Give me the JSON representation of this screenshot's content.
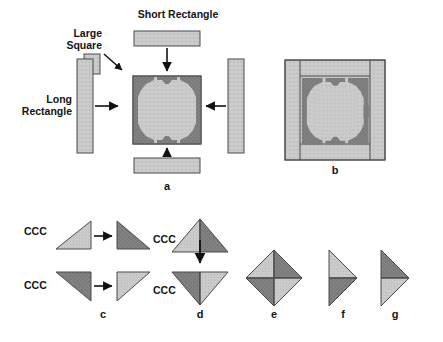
{
  "figure": {
    "title_present": false,
    "background": "#ffffff",
    "colors": {
      "light_fabric": "#c9c9c9",
      "light_fabric_dot": "#bdbdbd",
      "dark_fabric": "#7d7d7d",
      "dark_fabric_dot": "#6e6e6e",
      "outline": "#4a4a4a",
      "arrow": "#111111",
      "text": "#141414"
    }
  },
  "labels": {
    "large_square": "Large\nSquare",
    "short_rectangle": "Short Rectangle",
    "long_rectangle": "Long\nRectangle",
    "ccc": "CCC"
  },
  "panels": [
    {
      "id": "a",
      "letter": "a",
      "caption": "Assembled quilt block center with borders being added"
    },
    {
      "id": "b",
      "letter": "b",
      "caption": "Completed quilt block with long and short rectangle borders"
    },
    {
      "id": "c",
      "letter": "c",
      "caption": "Light and dark half-square triangle units labeled CCC"
    },
    {
      "id": "d",
      "letter": "d",
      "caption": "Two half-square triangles joined into up and down pointing units"
    },
    {
      "id": "e",
      "letter": "e",
      "caption": "Four triangles joined into a diamond square"
    },
    {
      "id": "f",
      "letter": "f",
      "caption": "Two triangles joined, light over dark, pointing right"
    },
    {
      "id": "g",
      "letter": "g",
      "caption": "Two triangles joined, dark over light, pointing right"
    }
  ],
  "ccc_labels": [
    {
      "text": "CCC",
      "position": "left-of-light-triangle-top"
    },
    {
      "text": "CCC",
      "position": "right-of-dark-triangle-top"
    },
    {
      "text": "CCC",
      "position": "left-of-dark-triangle-bottom"
    },
    {
      "text": "CCC",
      "position": "right-of-light-triangle-bottom"
    }
  ],
  "arrows": [
    {
      "name": "short-rectangle-down-arrow",
      "direction": "down"
    },
    {
      "name": "long-rectangle-right-arrow",
      "direction": "right"
    },
    {
      "name": "long-rectangle-left-arrow",
      "direction": "left"
    },
    {
      "name": "short-rectangle-up-arrow",
      "direction": "up"
    },
    {
      "name": "large-square-pointer-arrow",
      "direction": "down-right"
    },
    {
      "name": "ccc-top-arrow",
      "direction": "right"
    },
    {
      "name": "ccc-bottom-arrow",
      "direction": "right"
    },
    {
      "name": "panel-d-arrow",
      "direction": "down"
    }
  ],
  "block_grid": {
    "size": 16,
    "legend": {
      "0": "light",
      "1": "dark"
    },
    "rows": [
      "0000011111100000",
      "0000011111100000",
      "0001111001111000",
      "0011110000111100",
      "0111100000011110",
      "0110000000000110",
      "0110000000000110",
      "0110000000000110",
      "0110000000000110",
      "0110000000000110",
      "0110000000000110",
      "0111100000011110",
      "0011110000111100",
      "0001111001111000",
      "0000011111100000",
      "0000011111100000"
    ]
  }
}
